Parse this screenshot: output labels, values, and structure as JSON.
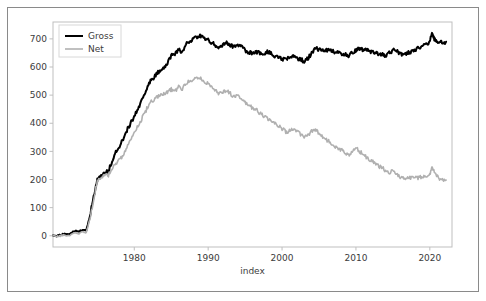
{
  "figure": {
    "background_color": "#ffffff",
    "frame_color": "#8a8a8a",
    "axis_color": "#bfbfbf",
    "text_color": "#3b3b3b"
  },
  "chart_data": {
    "type": "line",
    "title": "",
    "xlabel": "index",
    "ylabel": "",
    "xlim": [
      1969,
      2023
    ],
    "ylim": [
      -40,
      760
    ],
    "grid": false,
    "legend_position": "upper left",
    "xticks": [
      1980,
      1990,
      2000,
      2010,
      2020
    ],
    "xtick_labels": [
      "1980",
      "1990",
      "2000",
      "2010",
      "2020"
    ],
    "yticks": [
      0,
      100,
      200,
      300,
      400,
      500,
      600,
      700
    ],
    "ytick_labels": [
      "0",
      "100",
      "200",
      "300",
      "400",
      "500",
      "600",
      "700"
    ],
    "series": [
      {
        "name": "Gross",
        "color": "#000000",
        "linewidth": 2.0,
        "x": [
          1969.0,
          1969.5,
          1970.0,
          1970.5,
          1971.0,
          1971.5,
          1972.0,
          1972.5,
          1973.0,
          1973.5,
          1974.0,
          1974.5,
          1975.0,
          1975.5,
          1976.0,
          1976.5,
          1977.0,
          1977.5,
          1978.0,
          1978.5,
          1979.0,
          1979.5,
          1980.0,
          1980.5,
          1981.0,
          1981.5,
          1982.0,
          1982.5,
          1983.0,
          1983.5,
          1984.0,
          1984.5,
          1985.0,
          1985.5,
          1986.0,
          1986.5,
          1987.0,
          1987.5,
          1988.0,
          1988.5,
          1989.0,
          1989.5,
          1990.0,
          1990.5,
          1991.0,
          1991.5,
          1992.0,
          1992.5,
          1993.0,
          1993.5,
          1994.0,
          1994.5,
          1995.0,
          1995.5,
          1996.0,
          1996.5,
          1997.0,
          1997.5,
          1998.0,
          1998.5,
          1999.0,
          1999.5,
          2000.0,
          2000.5,
          2001.0,
          2001.5,
          2002.0,
          2002.5,
          2003.0,
          2003.5,
          2004.0,
          2004.5,
          2005.0,
          2005.5,
          2006.0,
          2006.5,
          2007.0,
          2007.5,
          2008.0,
          2008.5,
          2009.0,
          2009.5,
          2010.0,
          2010.5,
          2011.0,
          2011.5,
          2012.0,
          2012.5,
          2013.0,
          2013.5,
          2014.0,
          2014.5,
          2015.0,
          2015.5,
          2016.0,
          2016.5,
          2017.0,
          2017.5,
          2018.0,
          2018.5,
          2019.0,
          2019.5,
          2020.0,
          2020.3,
          2020.6,
          2021.0,
          2021.4,
          2021.8,
          2022.2
        ],
        "values": [
          2,
          0,
          3,
          6,
          4,
          10,
          18,
          14,
          22,
          20,
          70,
          140,
          200,
          215,
          225,
          230,
          265,
          300,
          320,
          345,
          375,
          400,
          425,
          450,
          480,
          505,
          545,
          558,
          575,
          590,
          600,
          615,
          640,
          648,
          660,
          655,
          680,
          690,
          700,
          705,
          710,
          700,
          695,
          688,
          675,
          668,
          680,
          685,
          678,
          672,
          680,
          672,
          660,
          652,
          648,
          655,
          650,
          645,
          655,
          648,
          640,
          632,
          630,
          625,
          635,
          640,
          632,
          628,
          620,
          630,
          650,
          668,
          660,
          662,
          658,
          660,
          655,
          650,
          648,
          645,
          640,
          650,
          660,
          665,
          662,
          658,
          655,
          650,
          648,
          645,
          642,
          650,
          660,
          655,
          648,
          645,
          650,
          655,
          660,
          668,
          672,
          680,
          690,
          720,
          700,
          688,
          695,
          685,
          690
        ]
      },
      {
        "name": "Net",
        "color": "#b0b0b0",
        "linewidth": 1.6,
        "x": [
          1969.0,
          1969.5,
          1970.0,
          1970.5,
          1971.0,
          1971.5,
          1972.0,
          1972.5,
          1973.0,
          1973.5,
          1974.0,
          1974.5,
          1975.0,
          1975.5,
          1976.0,
          1976.5,
          1977.0,
          1977.5,
          1978.0,
          1978.5,
          1979.0,
          1979.5,
          1980.0,
          1980.5,
          1981.0,
          1981.5,
          1982.0,
          1982.5,
          1983.0,
          1983.5,
          1984.0,
          1984.5,
          1985.0,
          1985.5,
          1986.0,
          1986.5,
          1987.0,
          1987.5,
          1988.0,
          1988.5,
          1989.0,
          1989.5,
          1990.0,
          1990.5,
          1991.0,
          1991.5,
          1992.0,
          1992.5,
          1993.0,
          1993.5,
          1994.0,
          1994.5,
          1995.0,
          1995.5,
          1996.0,
          1996.5,
          1997.0,
          1997.5,
          1998.0,
          1998.5,
          1999.0,
          1999.5,
          2000.0,
          2000.5,
          2001.0,
          2001.5,
          2002.0,
          2002.5,
          2003.0,
          2003.5,
          2004.0,
          2004.5,
          2005.0,
          2005.5,
          2006.0,
          2006.5,
          2007.0,
          2007.5,
          2008.0,
          2008.5,
          2009.0,
          2009.5,
          2010.0,
          2010.5,
          2011.0,
          2011.5,
          2012.0,
          2012.5,
          2013.0,
          2013.5,
          2014.0,
          2014.5,
          2015.0,
          2015.5,
          2016.0,
          2016.5,
          2017.0,
          2017.5,
          2018.0,
          2018.5,
          2019.0,
          2019.5,
          2020.0,
          2020.3,
          2020.6,
          2021.0,
          2021.4,
          2021.8,
          2022.2
        ],
        "values": [
          0,
          -2,
          0,
          2,
          0,
          5,
          10,
          8,
          14,
          12,
          60,
          130,
          195,
          208,
          212,
          215,
          240,
          258,
          268,
          285,
          312,
          340,
          365,
          390,
          415,
          440,
          470,
          480,
          492,
          500,
          505,
          512,
          520,
          515,
          528,
          522,
          540,
          550,
          558,
          565,
          560,
          548,
          540,
          530,
          515,
          505,
          512,
          515,
          505,
          495,
          500,
          488,
          472,
          462,
          455,
          448,
          435,
          425,
          418,
          408,
          398,
          390,
          380,
          370,
          372,
          378,
          370,
          360,
          350,
          358,
          372,
          378,
          362,
          350,
          340,
          332,
          322,
          312,
          305,
          298,
          288,
          298,
          312,
          300,
          288,
          278,
          268,
          258,
          250,
          242,
          232,
          225,
          232,
          222,
          210,
          205,
          203,
          205,
          208,
          206,
          210,
          215,
          218,
          245,
          225,
          212,
          200,
          195,
          198
        ]
      }
    ],
    "legend_entries": [
      {
        "label": "Gross",
        "color": "#000000"
      },
      {
        "label": "Net",
        "color": "#b0b0b0"
      }
    ]
  }
}
